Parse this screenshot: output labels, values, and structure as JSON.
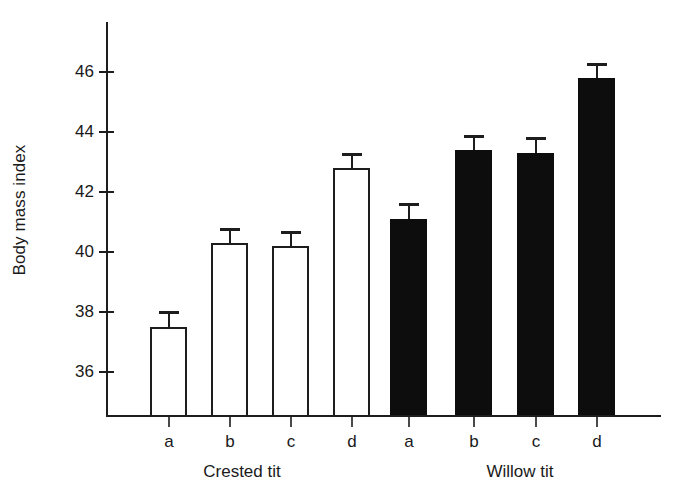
{
  "chart_data": {
    "type": "bar",
    "title": "",
    "subtitle": "",
    "xlabel": "",
    "ylabel": "Body mass index",
    "ylim": [
      34.8,
      47.2
    ],
    "yticks": [
      36,
      38,
      40,
      42,
      44,
      46
    ],
    "ytick_labels": [
      "36",
      "38",
      "40",
      "42",
      "44",
      "46"
    ],
    "grid": false,
    "legend": "none",
    "categories": [
      "a",
      "b",
      "c",
      "d",
      "a",
      "b",
      "c",
      "d"
    ],
    "groups": [
      {
        "name": "Crested tit",
        "style": "open",
        "fill": "#ffffff",
        "edge": "#1d1d1d",
        "categories": [
          "a",
          "b",
          "c",
          "d"
        ]
      },
      {
        "name": "Willow tit",
        "style": "filled",
        "fill": "#0d0d0d",
        "edge": "#0d0d0d",
        "categories": [
          "a",
          "b",
          "c",
          "d"
        ]
      }
    ],
    "values": [
      37.5,
      40.3,
      40.2,
      42.8,
      41.1,
      43.4,
      43.3,
      45.8
    ],
    "errors": [
      0.55,
      0.5,
      0.5,
      0.5,
      0.55,
      0.5,
      0.55,
      0.5
    ],
    "bars": [
      {
        "group": "Crested tit",
        "category": "a",
        "value": 37.5,
        "error": 0.55,
        "style": "open"
      },
      {
        "group": "Crested tit",
        "category": "b",
        "value": 40.3,
        "error": 0.5,
        "style": "open"
      },
      {
        "group": "Crested tit",
        "category": "c",
        "value": 40.2,
        "error": 0.5,
        "style": "open"
      },
      {
        "group": "Crested tit",
        "category": "d",
        "value": 42.8,
        "error": 0.5,
        "style": "open"
      },
      {
        "group": "Willow tit",
        "category": "a",
        "value": 41.1,
        "error": 0.55,
        "style": "filled"
      },
      {
        "group": "Willow tit",
        "category": "b",
        "value": 43.4,
        "error": 0.5,
        "style": "filled"
      },
      {
        "group": "Willow tit",
        "category": "c",
        "value": 43.3,
        "error": 0.55,
        "style": "filled"
      },
      {
        "group": "Willow tit",
        "category": "d",
        "value": 45.8,
        "error": 0.5,
        "style": "filled"
      }
    ]
  },
  "axis": {
    "y_title": "Body mass index",
    "tick_labels": [
      "46",
      "44",
      "42",
      "40",
      "38",
      "36"
    ]
  },
  "category_labels": [
    "a",
    "b",
    "c",
    "d",
    "a",
    "b",
    "c",
    "d"
  ],
  "group_labels": [
    "Crested tit",
    "Willow tit"
  ],
  "colors": {
    "axis": "#1d1d1d",
    "open_bar_fill": "#ffffff",
    "open_bar_edge": "#1d1d1d",
    "filled_bar": "#0d0d0d",
    "text": "#1a1a1a",
    "background": "#ffffff"
  }
}
